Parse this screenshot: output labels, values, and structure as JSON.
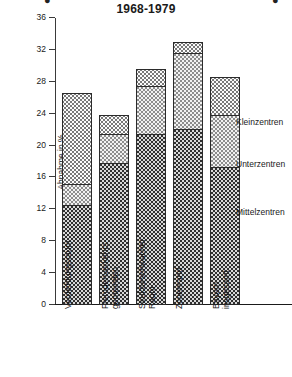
{
  "chart_data": {
    "type": "bar",
    "title": "1968-1979",
    "xlabel": "",
    "ylabel": "Abnahme in %",
    "ylim": [
      0,
      36
    ],
    "yticks": [
      0,
      4,
      8,
      12,
      16,
      20,
      24,
      28,
      32,
      36
    ],
    "grid": false,
    "stacked": true,
    "legend_position": "right",
    "categories": [
      "Verdichtungsraum",
      "Fremdenverkehrs-\ngemeinden",
      "Strukturschwacher\nRaum",
      "Zonenrand",
      "Bayern insgesamt"
    ],
    "series": [
      {
        "name": "Mittelzentren",
        "values": [
          12.3,
          17.6,
          21.2,
          21.8,
          17.0
        ]
      },
      {
        "name": "Unterzentren",
        "values": [
          2.6,
          3.6,
          6.0,
          9.5,
          6.6
        ]
      },
      {
        "name": "Kleinzentren",
        "values": [
          11.4,
          2.4,
          2.1,
          1.5,
          4.8
        ]
      }
    ],
    "totals": [
      26.3,
      23.6,
      29.3,
      32.8,
      28.4
    ],
    "segment_boundaries": [
      [
        12.3,
        14.9,
        26.3
      ],
      [
        17.6,
        21.2,
        23.6
      ],
      [
        21.2,
        27.2,
        29.3
      ],
      [
        21.8,
        31.3,
        32.8
      ],
      [
        17.0,
        23.6,
        28.4
      ]
    ]
  },
  "legend": {
    "items": [
      {
        "label": "Kleinzentren",
        "fill": "light"
      },
      {
        "label": "Unterzentren",
        "fill": "mid"
      },
      {
        "label": "Mittelzentren",
        "fill": "dark"
      }
    ]
  },
  "axis": {
    "tick_labels": [
      "36",
      "32",
      "28",
      "24",
      "20",
      "16",
      "12",
      "8",
      "4",
      "0"
    ]
  },
  "colors": {
    "dark": "#2f2f2f",
    "mid": "#8d8d8d",
    "light": "#fbfbfb",
    "outline": "#2b2b2b",
    "text": "#1a1a1a"
  }
}
